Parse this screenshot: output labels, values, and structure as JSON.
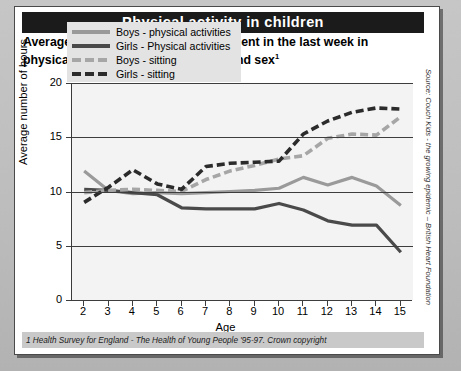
{
  "header": {
    "title": "Physical activity in children",
    "subtitle_line1": "Average number of hours children spent in the last week in",
    "subtitle_line2": "physical activity or 'sitting', by age and sex",
    "subtitle_footnote_marker": "1"
  },
  "source_note": "Source: Couch Kids - the growing epidemic – British Heart Foundation",
  "footnote": "1 Health Survey for England - The Health of Young People '95-97. Crown copyright",
  "colors": {
    "title_bar": "#1b1b1b",
    "card": "#ffffff",
    "page_background": "#bdbdbd",
    "plot_background": "#f3f3f3",
    "axis": "#3d3d3d",
    "boys_physical": "#9a9a9a",
    "girls_physical": "#4a4a4a",
    "boys_sitting": "#a6a6a6",
    "girls_sitting": "#2b2b2b",
    "legend_background": "#e3e3e3",
    "footnote_background": "#c9c9c9"
  },
  "chart_data": {
    "type": "line",
    "title": "Average number of hours children spent in the last week in physical activity or 'sitting', by age and sex",
    "xlabel": "Age",
    "ylabel": "Average number of hours",
    "xlim": [
      1.5,
      15.5
    ],
    "ylim": [
      0,
      20
    ],
    "yticks": [
      0,
      5,
      10,
      15,
      20
    ],
    "grid": true,
    "legend_position": "top-left",
    "categories": [
      2,
      3,
      4,
      5,
      6,
      7,
      8,
      9,
      10,
      11,
      12,
      13,
      14,
      15
    ],
    "x": [
      2,
      3,
      4,
      5,
      6,
      7,
      8,
      9,
      10,
      11,
      12,
      13,
      14,
      15
    ],
    "series": [
      {
        "name": "Boys - physical activities",
        "style": "solid",
        "color": "#9a9a9a",
        "values": [
          11.9,
          10.1,
          9.8,
          9.9,
          9.8,
          9.9,
          10.0,
          10.1,
          10.3,
          11.3,
          10.6,
          11.3,
          10.5,
          8.7
        ]
      },
      {
        "name": "Girls - Physical activities",
        "style": "solid",
        "color": "#4a4a4a",
        "values": [
          10.2,
          10.1,
          9.9,
          9.7,
          8.5,
          8.4,
          8.4,
          8.4,
          8.9,
          8.3,
          7.3,
          6.9,
          6.9,
          4.4
        ]
      },
      {
        "name": "Boys - sitting",
        "style": "dashed",
        "color": "#a6a6a6",
        "values": [
          9.9,
          10.1,
          10.2,
          10.1,
          10.0,
          11.1,
          11.9,
          12.4,
          13.0,
          13.3,
          14.9,
          15.3,
          15.2,
          16.9
        ]
      },
      {
        "name": "Girls - sitting",
        "style": "dashed",
        "color": "#2b2b2b",
        "values": [
          9.0,
          10.4,
          12.0,
          10.7,
          10.2,
          12.3,
          12.6,
          12.7,
          12.8,
          15.3,
          16.5,
          17.3,
          17.7,
          17.6
        ]
      }
    ]
  },
  "legend": {
    "items": [
      {
        "label": "Boys - physical activities",
        "color": "#9a9a9a",
        "style": "solid"
      },
      {
        "label": "Girls - Physical activities",
        "color": "#4a4a4a",
        "style": "solid"
      },
      {
        "label": "Boys - sitting",
        "color": "#a6a6a6",
        "style": "dashed"
      },
      {
        "label": "Girls - sitting",
        "color": "#2b2b2b",
        "style": "dashed"
      }
    ]
  }
}
